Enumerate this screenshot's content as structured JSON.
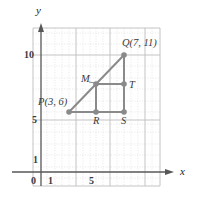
{
  "figure": {
    "kind": "coordinate-plane-diagram",
    "axes": {
      "x_label": "x",
      "y_label": "y",
      "origin_label": "0",
      "x_ticks": [
        "1",
        "5"
      ],
      "y_ticks": [
        "1",
        "5",
        "10"
      ]
    },
    "colors": {
      "grid_minor": "#d9d9d9",
      "grid_major": "#b8b8b8",
      "axis": "#4d4d4d",
      "figure": "#8a8a8a",
      "text": "#3a3a3a"
    },
    "points": [
      {
        "id": "P",
        "label": "P(3, 6)",
        "x": 3,
        "y": 6
      },
      {
        "id": "Q",
        "label": "Q(7, 11)",
        "x": 7,
        "y": 11
      },
      {
        "id": "M",
        "label": "M",
        "x": 5,
        "y": 8.5
      },
      {
        "id": "T",
        "label": "T",
        "x": 7,
        "y": 8.5
      },
      {
        "id": "R",
        "label": "R",
        "x": 5,
        "y": 6
      },
      {
        "id": "S",
        "label": "S",
        "x": 7,
        "y": 6
      }
    ],
    "segments": [
      {
        "from": "P",
        "to": "Q"
      },
      {
        "from": "P",
        "to": "S"
      },
      {
        "from": "Q",
        "to": "S"
      },
      {
        "from": "M",
        "to": "T"
      },
      {
        "from": "M",
        "to": "R"
      }
    ]
  }
}
